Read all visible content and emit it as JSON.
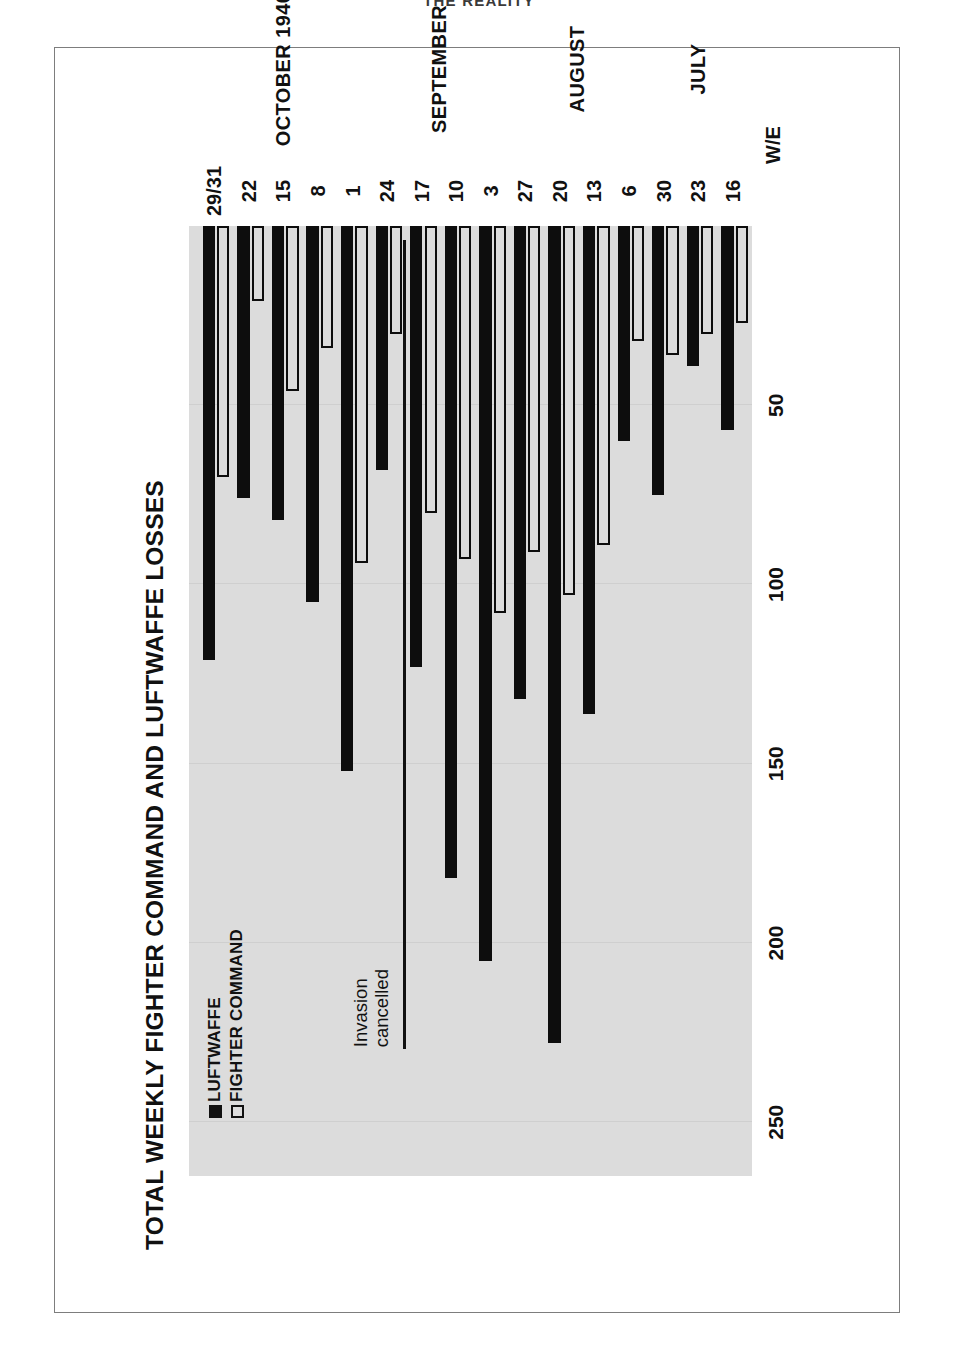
{
  "page": {
    "running_head": "THE REALITY"
  },
  "chart_data": {
    "type": "bar",
    "orientation": "horizontal",
    "title": "TOTAL WEEKLY FIGHTER COMMAND AND LUFTWAFFE LOSSES",
    "xlabel": "",
    "ylabel": "",
    "value_axis_label": "",
    "value_ticks": [
      50,
      100,
      150,
      200,
      250
    ],
    "value_tick_labels": [
      "50",
      "100",
      "150",
      "200",
      "250"
    ],
    "vlim": [
      0,
      265
    ],
    "grid": true,
    "legend_position": "top-left",
    "week_ending_prefix": "W/E",
    "categories": [
      "16",
      "23",
      "30",
      "6",
      "13",
      "20",
      "27",
      "3",
      "10",
      "17",
      "24",
      "1",
      "8",
      "15",
      "22",
      "29/31"
    ],
    "months": [
      {
        "label": "JULY",
        "span": [
          0,
          2
        ]
      },
      {
        "label": "AUGUST",
        "span": [
          3,
          6
        ]
      },
      {
        "label": "SEPTEMBER",
        "span": [
          7,
          10
        ]
      },
      {
        "label": "OCTOBER 1940",
        "span": [
          11,
          15
        ]
      }
    ],
    "year": "1940",
    "series": [
      {
        "name": "FIGHTER COMMAND",
        "key": "fighter_command",
        "style": "outline",
        "color": "#ffffff",
        "edge": "#0d0d0d",
        "values": [
          27,
          30,
          36,
          32,
          89,
          103,
          91,
          108,
          93,
          80,
          30,
          94,
          34,
          46,
          21,
          70
        ]
      },
      {
        "name": "LUFTWAFFE",
        "key": "luftwaffe",
        "style": "solid",
        "color": "#0d0d0d",
        "edge": "#0d0d0d",
        "values": [
          57,
          39,
          75,
          60,
          136,
          228,
          132,
          205,
          182,
          123,
          68,
          152,
          105,
          82,
          76,
          121
        ]
      }
    ],
    "annotations": [
      {
        "text_lines": [
          "Invasion",
          "cancelled"
        ],
        "at_category": "17",
        "type": "vertical-rule-with-label"
      }
    ]
  }
}
